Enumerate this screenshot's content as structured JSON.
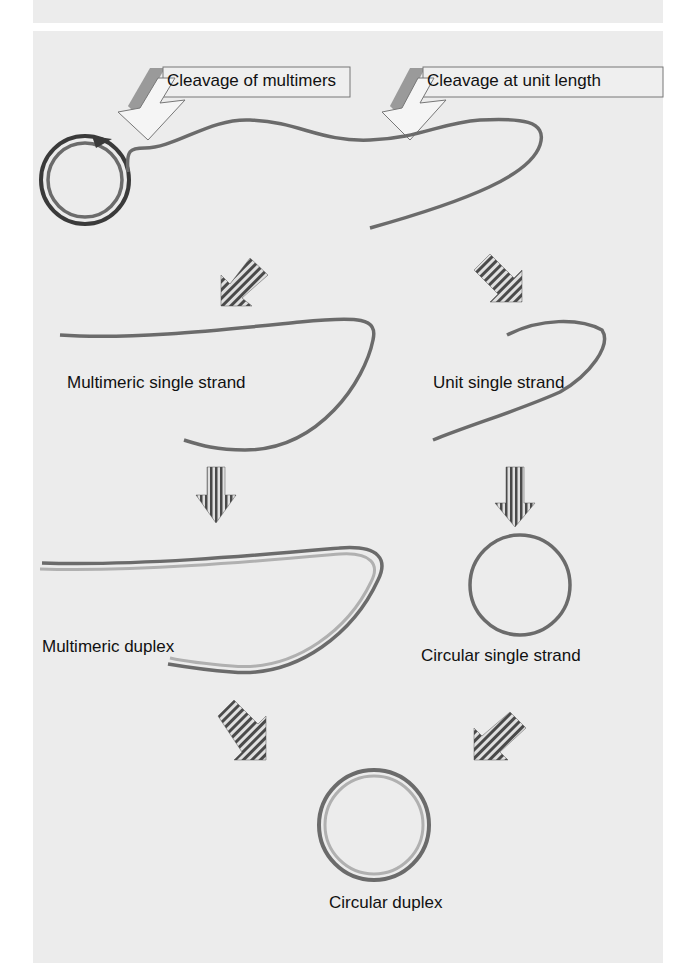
{
  "figure": {
    "callouts": [
      {
        "id": "cleavage-multimers",
        "text": "Cleavage of multimers"
      },
      {
        "id": "cleavage-unit",
        "text": "Cleavage at unit length"
      }
    ],
    "labels": {
      "multimeric_single_strand": "Multimeric single strand",
      "unit_single_strand": "Unit single strand",
      "multimeric_duplex": "Multimeric duplex",
      "circular_single_strand": "Circular single strand",
      "circular_duplex": "Circular duplex"
    },
    "colors": {
      "panel_bg": "#ececec",
      "strand_dark": "#6b6b6b",
      "strand_light": "#a8a8a8",
      "circle_dark": "#3a3a3a",
      "callout_shadow": "#9a9a9a"
    }
  }
}
